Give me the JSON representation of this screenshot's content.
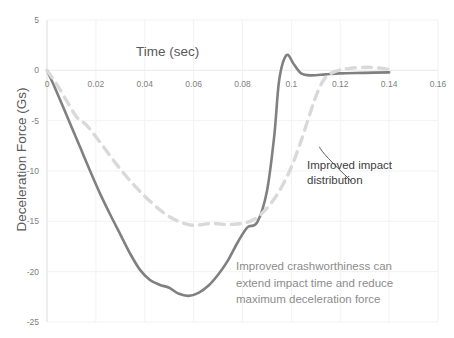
{
  "chart_data": {
    "type": "line",
    "title": "Time (sec)",
    "xlabel": "Time (sec)",
    "ylabel": "Deceleration Force (Gs)",
    "xlim": [
      0,
      0.16
    ],
    "ylim": [
      -25,
      5
    ],
    "xticks": [
      "0",
      "0.02",
      "0.04",
      "0.06",
      "0.08",
      "0.1",
      "0.12",
      "0.14",
      "0.16"
    ],
    "xtick_values": [
      0,
      0.02,
      0.04,
      0.06,
      0.08,
      0.1,
      0.12,
      0.14,
      0.16
    ],
    "yticks": [
      "5",
      "0",
      "-5",
      "-10",
      "-15",
      "-20",
      "-25"
    ],
    "ytick_values": [
      5,
      0,
      -5,
      -10,
      -15,
      -20,
      -25
    ],
    "grid": true,
    "legend": null,
    "series": [
      {
        "name": "baseline-deceleration",
        "style": "solid",
        "color": "#808080",
        "x": [
          0.0,
          0.003,
          0.006,
          0.01,
          0.014,
          0.018,
          0.022,
          0.026,
          0.03,
          0.034,
          0.038,
          0.042,
          0.046,
          0.05,
          0.054,
          0.058,
          0.062,
          0.066,
          0.07,
          0.074,
          0.078,
          0.082,
          0.086,
          0.09,
          0.093,
          0.095,
          0.098,
          0.101,
          0.104,
          0.108,
          0.114,
          0.12,
          0.13,
          0.14
        ],
        "y": [
          0.0,
          -1.6,
          -3.3,
          -5.6,
          -7.9,
          -10.2,
          -12.4,
          -14.4,
          -16.3,
          -18.2,
          -19.8,
          -20.8,
          -21.3,
          -21.6,
          -22.2,
          -22.4,
          -22.1,
          -21.4,
          -20.3,
          -18.9,
          -17.1,
          -15.6,
          -15.1,
          -12.0,
          -6.5,
          -1.0,
          1.5,
          0.6,
          -0.3,
          -0.5,
          -0.4,
          -0.3,
          -0.25,
          -0.2
        ]
      },
      {
        "name": "improved-impact-distribution",
        "style": "dashed",
        "color": "#d9d9d9",
        "x": [
          0.0,
          0.004,
          0.008,
          0.012,
          0.016,
          0.02,
          0.024,
          0.028,
          0.032,
          0.036,
          0.04,
          0.044,
          0.048,
          0.052,
          0.056,
          0.06,
          0.064,
          0.068,
          0.072,
          0.076,
          0.08,
          0.084,
          0.088,
          0.092,
          0.096,
          0.1,
          0.104,
          0.108,
          0.111,
          0.114,
          0.118,
          0.124,
          0.132,
          0.14
        ],
        "y": [
          0.0,
          -1.4,
          -3.0,
          -4.6,
          -5.4,
          -6.6,
          -7.9,
          -9.2,
          -10.4,
          -11.5,
          -12.5,
          -13.4,
          -14.2,
          -14.8,
          -15.2,
          -15.4,
          -15.3,
          -15.2,
          -15.3,
          -15.3,
          -15.2,
          -14.9,
          -14.2,
          -13.1,
          -11.6,
          -9.6,
          -7.0,
          -4.0,
          -2.0,
          -0.7,
          -0.1,
          0.2,
          0.3,
          0.1
        ]
      }
    ],
    "annotations": [
      {
        "name": "improved-impact-distribution-callout",
        "text": "Improved impact\ndistribution",
        "leader_from": [
          0.1115,
          -7.6
        ],
        "leader_to": [
          0.1245,
          -11.0
        ]
      },
      {
        "name": "crashworthiness-note",
        "text": "Improved crashworthiness can\nextend impact time and reduce\nmaximum deceleration force"
      }
    ],
    "colors": {
      "solid_series": "#808080",
      "dashed_series": "#d9d9d9",
      "grid": "#f2f2f2",
      "axis_text": "#808080",
      "note_text": "#8c8c8c",
      "callout_text": "#404040",
      "background": "#ffffff"
    }
  }
}
